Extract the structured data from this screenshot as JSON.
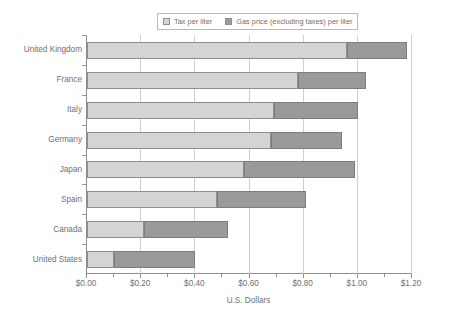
{
  "chart_data": {
    "type": "bar",
    "orientation": "horizontal",
    "stacked": true,
    "title": "",
    "xlabel": "U.S. Dollars",
    "ylabel": "",
    "xlim": [
      0,
      1.2
    ],
    "xticks": [
      0,
      0.2,
      0.4,
      0.6,
      0.8,
      1.0,
      1.2
    ],
    "xtick_labels": [
      "$0.00",
      "$0.20",
      "$0.40",
      "$0.60",
      "$0.80",
      "$1.00",
      "$1.20"
    ],
    "minor_tick_step": 0.1,
    "grid": "vertical",
    "legend_position": "top",
    "categories": [
      "United Kingdom",
      "France",
      "Italy",
      "Germany",
      "Japan",
      "Spain",
      "Canada",
      "United States"
    ],
    "series": [
      {
        "name": "Tax per liter",
        "color": "#d4d4d4",
        "values": [
          0.96,
          0.78,
          0.69,
          0.68,
          0.58,
          0.48,
          0.21,
          0.1
        ]
      },
      {
        "name": "Gas price (excluding taxes) per liter",
        "color": "#9a9a9a",
        "values": [
          0.22,
          0.25,
          0.31,
          0.26,
          0.41,
          0.33,
          0.31,
          0.3
        ]
      }
    ],
    "totals": [
      1.18,
      1.03,
      1.0,
      0.94,
      0.99,
      0.81,
      0.52,
      0.4
    ]
  },
  "legend": {
    "entries": [
      {
        "label": "Tax per liter",
        "swatch": "legend-swatch-tax"
      },
      {
        "label": "Gas price (excluding taxes) per liter",
        "swatch": "legend-swatch-gas"
      }
    ]
  },
  "axis": {
    "x_title": "U.S. Dollars"
  },
  "colors": {
    "tax": "#d4d4d4",
    "gas": "#9a9a9a",
    "axis": "#8d8d8d",
    "grid": "#cfcfcf",
    "text": "#6f6f6f",
    "background": "#ffffff"
  }
}
